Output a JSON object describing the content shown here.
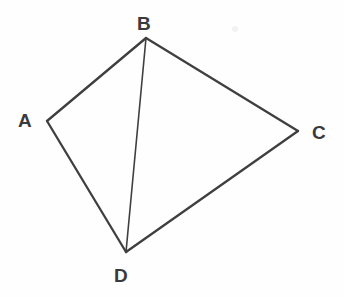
{
  "figure": {
    "background_color": "#fefefe",
    "stroke_color": "#3f3f41",
    "label_color": "#3a3a3c"
  },
  "chart_data": {
    "type": "diagram",
    "xlabel": "",
    "ylabel": "",
    "xlim": [
      0,
      344
    ],
    "ylim": [
      0,
      297
    ],
    "grid": false,
    "legend": null,
    "vertices": [
      {
        "id": "A",
        "label": "A",
        "x": 47,
        "y": 121,
        "label_x": 18,
        "label_y": 111
      },
      {
        "id": "B",
        "label": "B",
        "x": 146,
        "y": 38,
        "label_x": 137,
        "label_y": 14
      },
      {
        "id": "C",
        "label": "C",
        "x": 298,
        "y": 131,
        "label_x": 312,
        "label_y": 123
      },
      {
        "id": "D",
        "label": "D",
        "x": 126,
        "y": 252,
        "label_x": 114,
        "label_y": 266
      }
    ],
    "edges": [
      {
        "id": "AB",
        "from": "A",
        "to": "B",
        "x1": 47,
        "y1": 121,
        "x2": 146,
        "y2": 38,
        "width": 2.3,
        "kind": "side"
      },
      {
        "id": "BC",
        "from": "B",
        "to": "C",
        "x1": 146,
        "y1": 38,
        "x2": 298,
        "y2": 131,
        "width": 2.3,
        "kind": "side"
      },
      {
        "id": "CD",
        "from": "C",
        "to": "D",
        "x1": 298,
        "y1": 131,
        "x2": 126,
        "y2": 252,
        "width": 2.3,
        "kind": "side"
      },
      {
        "id": "DA",
        "from": "D",
        "to": "A",
        "x1": 126,
        "y1": 252,
        "x2": 47,
        "y2": 121,
        "width": 2.3,
        "kind": "side"
      },
      {
        "id": "BD",
        "from": "B",
        "to": "D",
        "x1": 146,
        "y1": 38,
        "x2": 126,
        "y2": 252,
        "width": 1.6,
        "kind": "diagonal"
      }
    ],
    "artifacts": [
      {
        "id": "scan-speck",
        "x": 235,
        "y": 29,
        "r": 3
      }
    ]
  }
}
